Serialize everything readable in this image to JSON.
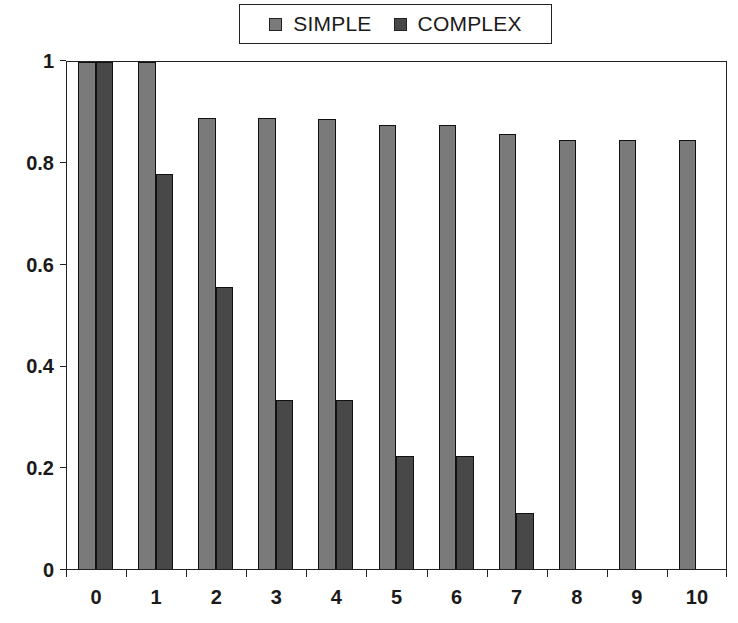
{
  "chart_data": {
    "type": "bar",
    "title": "",
    "xlabel": "",
    "ylabel": "",
    "categories": [
      "0",
      "1",
      "2",
      "3",
      "4",
      "5",
      "6",
      "7",
      "8",
      "9",
      "10"
    ],
    "series": [
      {
        "name": "SIMPLE",
        "color": "#7a7a7a",
        "values": [
          1.0,
          1.0,
          0.889,
          0.889,
          0.886,
          0.875,
          0.875,
          0.857,
          0.846,
          0.846,
          0.846
        ]
      },
      {
        "name": "COMPLEX",
        "color": "#484848",
        "values": [
          1.0,
          0.778,
          0.556,
          0.333,
          0.333,
          0.222,
          0.222,
          0.111,
          0,
          0,
          0
        ]
      }
    ],
    "ylim": [
      0,
      1
    ],
    "yticks": [
      "0",
      "0.2",
      "0.4",
      "0.6",
      "0.8",
      "1"
    ],
    "grid": false,
    "legend_position": "top-center"
  },
  "legend": {
    "items": [
      {
        "label": "SIMPLE",
        "color": "#7a7a7a"
      },
      {
        "label": "COMPLEX",
        "color": "#484848"
      }
    ]
  }
}
